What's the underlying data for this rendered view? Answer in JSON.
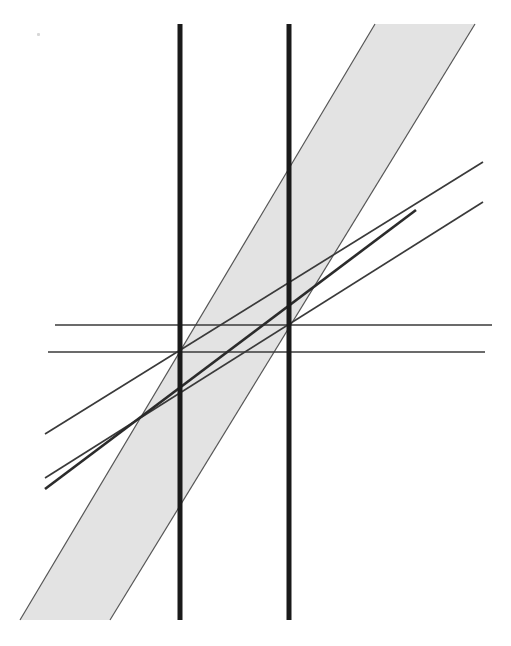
{
  "figure": {
    "background_color": "#ffffff",
    "width": 511,
    "height": 646
  },
  "style": {
    "band_fill": "#e3e3e3",
    "band_edge_color": "#555555",
    "band_edge_width": 1.2,
    "thick_line_color": "#1a1a1a",
    "thick_line_width": 5,
    "medium_line_color": "#2b2b2b",
    "medium_line_width": 2.6,
    "thin_line_color": "#3a3a3a",
    "thin_line_width": 1.5,
    "dotted_color": "#1a1a1a",
    "dotted_width": 4,
    "dotted_dash": "4 5"
  },
  "chart_data": {
    "type": "line",
    "xlabel": "",
    "ylabel": "",
    "xlim": [
      0,
      511
    ],
    "ylim": [
      646,
      0
    ],
    "grid": false,
    "legend": "none",
    "note": "Coordinates are in image pixel space; y increases downward.",
    "series": [
      {
        "name": "vertical-line-left",
        "kind": "vertical-rule",
        "style": "thick-solid",
        "x": 180,
        "y_start": 24,
        "y_end": 620
      },
      {
        "name": "vertical-line-right",
        "kind": "vertical-rule",
        "style": "thick-solid",
        "x": 289,
        "y_start": 24,
        "y_end": 620
      },
      {
        "name": "horizontal-line-upper",
        "kind": "horizontal-rule",
        "style": "thin-solid",
        "y": 325,
        "x_start": 55,
        "x_end": 492
      },
      {
        "name": "horizontal-line-lower",
        "kind": "horizontal-rule",
        "style": "thin-solid",
        "y": 352,
        "x_start": 48,
        "x_end": 485
      },
      {
        "name": "steep-line-thick",
        "kind": "segment",
        "style": "medium-solid",
        "x1": 45,
        "y1": 489,
        "x2": 416,
        "y2": 210
      },
      {
        "name": "shallow-line-upper",
        "kind": "segment",
        "style": "thin-solid",
        "x1": 45,
        "y1": 434,
        "x2": 483,
        "y2": 162
      },
      {
        "name": "shallow-line-lower",
        "kind": "segment",
        "style": "thin-solid",
        "x1": 45,
        "y1": 478,
        "x2": 483,
        "y2": 202
      },
      {
        "name": "confidence-band",
        "kind": "polygon-band",
        "style": "gray-fill-outlined",
        "fill": "#e3e3e3",
        "slope_dy_dx": -1.65,
        "left_edge": [
          [
            20,
            620
          ],
          [
            375,
            24
          ]
        ],
        "right_edge": [
          [
            110,
            620
          ],
          [
            475,
            24
          ]
        ],
        "vertices": [
          [
            20,
            620
          ],
          [
            375,
            24
          ],
          [
            475,
            24
          ],
          [
            110,
            620
          ]
        ]
      },
      {
        "name": "dotted-drop-left",
        "kind": "vertical-dotted",
        "style": "dotted",
        "x": 180,
        "y_start": 352,
        "y_end": 492
      },
      {
        "name": "dotted-drop-right",
        "kind": "vertical-dotted",
        "style": "dotted",
        "x": 289,
        "y_start": 172,
        "y_end": 325
      }
    ],
    "marked_points": [
      {
        "name": "intersection-left",
        "x": 180,
        "y": 352
      },
      {
        "name": "intersection-right",
        "x": 289,
        "y": 325
      }
    ],
    "annotations": []
  },
  "artifacts": [
    {
      "name": "scan-speck",
      "x": 37,
      "y": 33
    }
  ]
}
